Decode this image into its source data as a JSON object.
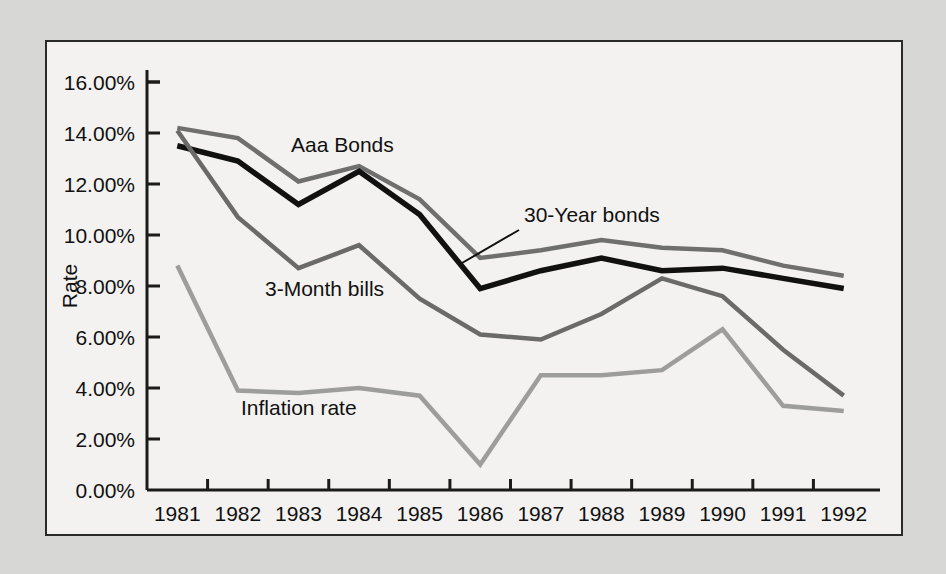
{
  "chart_data": {
    "type": "line",
    "title": "",
    "xlabel": "",
    "ylabel": "Rate",
    "categories": [
      "1981",
      "1982",
      "1983",
      "1984",
      "1985",
      "1986",
      "1987",
      "1988",
      "1989",
      "1990",
      "1991",
      "1992"
    ],
    "ylim": [
      0,
      16
    ],
    "ytick_values": [
      0,
      2,
      4,
      6,
      8,
      10,
      12,
      14,
      16
    ],
    "ytick_labels": [
      "0.00%",
      "2.00%",
      "4.00%",
      "6.00%",
      "8.00%",
      "10.00%",
      "12.00%",
      "14.00%",
      "16.00%"
    ],
    "grid": false,
    "legend": "inline-annotations",
    "series": [
      {
        "name": "Aaa Bonds",
        "color": "#6f6f6f",
        "values": [
          14.2,
          13.8,
          12.1,
          12.7,
          11.4,
          9.1,
          9.4,
          9.8,
          9.5,
          9.4,
          8.8,
          8.4
        ]
      },
      {
        "name": "30-Year bonds",
        "color": "#111111",
        "values": [
          13.5,
          12.9,
          11.2,
          12.5,
          10.8,
          7.9,
          8.6,
          9.1,
          8.6,
          8.7,
          8.3,
          7.9
        ]
      },
      {
        "name": "3-Month bills",
        "color": "#6a6a6a",
        "values": [
          14.1,
          10.7,
          8.7,
          9.6,
          7.5,
          6.1,
          5.9,
          6.9,
          8.3,
          7.6,
          5.5,
          3.7
        ]
      },
      {
        "name": "Inflation rate",
        "color": "#9d9d9d",
        "values": [
          8.8,
          3.9,
          3.8,
          4.0,
          3.7,
          1.0,
          4.5,
          4.5,
          4.7,
          6.3,
          3.3,
          3.1
        ]
      }
    ],
    "annotations": [
      {
        "label": "Aaa Bonds",
        "x": 291,
        "y": 152,
        "leader": null
      },
      {
        "label": "30-Year bonds",
        "x": 524,
        "y": 222,
        "leader": {
          "x1": 519,
          "y1": 230,
          "x2": 462,
          "y2": 263
        }
      },
      {
        "label": "3-Month bills",
        "x": 265,
        "y": 296,
        "leader": null
      },
      {
        "label": "Inflation rate",
        "x": 241,
        "y": 415,
        "leader": null
      }
    ]
  },
  "chart_geometry": {
    "plot_left": 147,
    "plot_right": 874,
    "plot_top": 82,
    "plot_bottom": 490
  },
  "colors": {
    "page_background": "#d7d7d5",
    "figure_background": "#f3f2f0",
    "frame_border": "#2a2a2a",
    "axis": "#1b1b1b",
    "text": "#111111"
  }
}
